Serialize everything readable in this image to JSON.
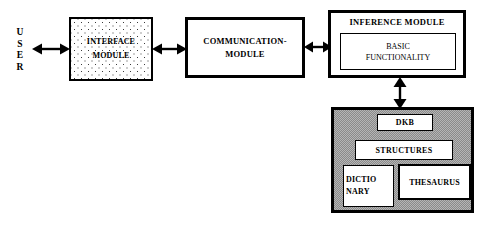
{
  "diagram": {
    "background_color": "#ffffff",
    "line_color": "#000000",
    "dkb_fill_color": "#9a9a9a",
    "interface_fill": "stippled-dots"
  },
  "actor": {
    "name": "USER",
    "letters": [
      "U",
      "S",
      "E",
      "R"
    ]
  },
  "modules": {
    "interface": {
      "label": "INTERFACE\nMODULE"
    },
    "communication": {
      "label": "COMMUNICATION-\nMODULE"
    },
    "inference": {
      "title": "INFERENCE MODULE",
      "inner": {
        "label": "BASIC\nFUNCTIONALITY"
      }
    }
  },
  "knowledge_base": {
    "heading": "DKB",
    "items": [
      {
        "label": "STRUCTURES"
      },
      {
        "label": "DICTIO\nNARY"
      },
      {
        "label": "THESAURUS"
      }
    ]
  },
  "connectors": [
    {
      "name": "user-to-interface",
      "type": "bidirectional-horizontal"
    },
    {
      "name": "interface-to-communication",
      "type": "bidirectional-horizontal"
    },
    {
      "name": "communication-to-inference",
      "type": "bidirectional-horizontal"
    },
    {
      "name": "inference-to-dkb",
      "type": "bidirectional-vertical"
    }
  ]
}
